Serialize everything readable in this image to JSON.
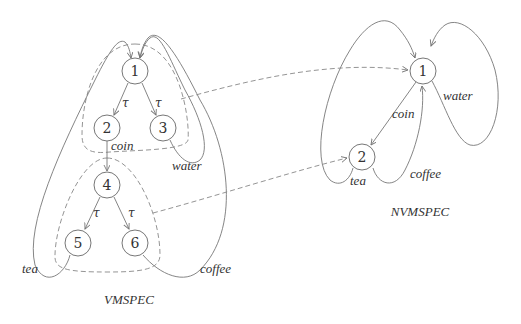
{
  "diagrams": {
    "vmspec": {
      "title": "VMSPEC",
      "nodes": [
        {
          "id": "1",
          "label": "1"
        },
        {
          "id": "2",
          "label": "2"
        },
        {
          "id": "3",
          "label": "3"
        },
        {
          "id": "4",
          "label": "4"
        },
        {
          "id": "5",
          "label": "5"
        },
        {
          "id": "6",
          "label": "6"
        }
      ],
      "edges": [
        {
          "from": "1",
          "to": "2",
          "label": "τ"
        },
        {
          "from": "1",
          "to": "3",
          "label": "τ"
        },
        {
          "from": "2",
          "to": "4",
          "label": "coin"
        },
        {
          "from": "3",
          "to": "1",
          "label": "water"
        },
        {
          "from": "4",
          "to": "5",
          "label": "τ"
        },
        {
          "from": "4",
          "to": "6",
          "label": "τ"
        },
        {
          "from": "5",
          "to": "1",
          "label": "tea"
        },
        {
          "from": "6",
          "to": "1",
          "label": "coffee"
        }
      ]
    },
    "nvmspec": {
      "title": "NVMSPEC",
      "nodes": [
        {
          "id": "1",
          "label": "1"
        },
        {
          "id": "2",
          "label": "2"
        }
      ],
      "edges": [
        {
          "from": "1",
          "to": "2",
          "label": "coin"
        },
        {
          "from": "1",
          "to": "1",
          "label": "water"
        },
        {
          "from": "2",
          "to": "1",
          "label": "tea"
        },
        {
          "from": "2",
          "to": "1",
          "label": "coffee"
        }
      ]
    },
    "mappings": [
      {
        "from_group": "vmspec: {1,2,3}",
        "to": "nvmspec: 1",
        "style": "dashed"
      },
      {
        "from_group": "vmspec: {4,5,6}",
        "to": "nvmspec: 2",
        "style": "dashed"
      }
    ]
  }
}
